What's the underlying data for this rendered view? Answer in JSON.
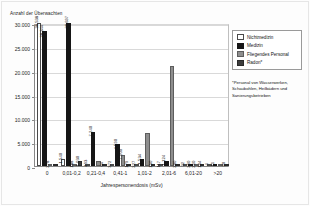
{
  "axis": {
    "y_title": "Anzahl der Überwachten",
    "x_title": "Jahrespersonendosis (mSv)",
    "y_ticks": [
      "0",
      "5.000",
      "10.000",
      "15.000",
      "20.000",
      "25.000",
      "30.000"
    ]
  },
  "legend": {
    "items": [
      {
        "label": "Nichtmedizin",
        "swatch": "s0",
        "color": "#ffffff"
      },
      {
        "label": "Medizin",
        "swatch": "s1",
        "color": "#161616"
      },
      {
        "label": "Fliegendes Personal",
        "swatch": "s2",
        "color": "#8e8e8e"
      },
      {
        "label": "Radon*",
        "swatch": "s3",
        "color": "#3d3d3d"
      }
    ]
  },
  "footnote": "*Personal von Wasserwerken, Schaubohlen, Heilbädern und Sanierungsbetrieben",
  "chart_data": {
    "type": "bar",
    "title": "",
    "xlabel": "Jahrespersonendosis (mSv)",
    "ylabel": "Anzahl der Überwachten",
    "ylim": [
      0,
      30000
    ],
    "grid": true,
    "legend_position": "right",
    "categories": [
      "0",
      "0,01-0,2",
      "0,21-0,4",
      "0,41-1",
      "1,01-2",
      "2,01-6",
      "6,01-20",
      ">20"
    ],
    "series": [
      {
        "name": "Nichtmedizin",
        "values": [
          38538,
          1540,
          493,
          372,
          227,
          117,
          32,
          4
        ]
      },
      {
        "name": "Medizin",
        "values": [
          28344,
          38697,
          7240,
          4590,
          1534,
          1124,
          290,
          11
        ]
      },
      {
        "name": "Fliegendes Personal",
        "values": [
          278,
          188,
          1100,
          2400,
          7000,
          21000,
          210,
          0
        ]
      },
      {
        "name": "Radon*",
        "values": [
          0,
          1030,
          64,
          179,
          150,
          200,
          144,
          20
        ]
      }
    ],
    "value_labels": {
      "0": {
        "Nichtmedizin": "38.538",
        "Medizin": "28.344",
        "Fliegendes Personal": "278",
        "Radon*": ""
      },
      "0,01-0,2": {
        "Nichtmedizin": "1.540",
        "Medizin": "38.697",
        "Fliegendes Personal": "188",
        "Radon*": "1.030"
      },
      "0,21-0,4": {
        "Nichtmedizin": "493",
        "Medizin": "7.240",
        "Fliegendes Personal": "",
        "Radon*": "64"
      },
      "0,41-1": {
        "Nichtmedizin": "372",
        "Medizin": "4.590",
        "Fliegendes Personal": "7.000",
        "Radon*": "179"
      },
      "1,01-2": {
        "Nichtmedizin": "227",
        "Medizin": "1.534",
        "Fliegendes Personal": "",
        "Radon*": "150"
      },
      "2,01-6": {
        "Nichtmedizin": "117",
        "Medizin": "1.124",
        "Fliegendes Personal": "",
        "Radon*": "200"
      },
      "6,01-20": {
        "Nichtmedizin": "32",
        "Medizin": "290",
        "Fliegendes Personal": "210",
        "Radon*": "144"
      },
      ">20": {
        "Nichtmedizin": "4",
        "Medizin": "11",
        "Fliegendes Personal": "",
        "Radon*": "20"
      }
    }
  }
}
